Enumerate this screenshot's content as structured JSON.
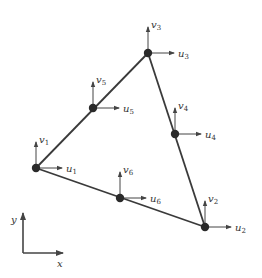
{
  "diagram": {
    "type": "six-node triangular finite element with nodal displacement DOFs",
    "colors": {
      "edge": "#3a3a3a",
      "node": "#2a2a2a",
      "arrow": "#444444",
      "text": "#333333"
    },
    "nodes": [
      {
        "id": 1,
        "x": 36,
        "y": 168,
        "u_label": "u",
        "u_sub": "1",
        "v_label": "v",
        "v_sub": "1"
      },
      {
        "id": 2,
        "x": 205,
        "y": 227,
        "u_label": "u",
        "u_sub": "2",
        "v_label": "v",
        "v_sub": "2"
      },
      {
        "id": 3,
        "x": 148,
        "y": 53,
        "u_label": "u",
        "u_sub": "3",
        "v_label": "v",
        "v_sub": "3"
      },
      {
        "id": 4,
        "x": 175,
        "y": 134,
        "u_label": "u",
        "u_sub": "4",
        "v_label": "v",
        "v_sub": "4"
      },
      {
        "id": 5,
        "x": 93,
        "y": 108,
        "u_label": "u",
        "u_sub": "5",
        "v_label": "v",
        "v_sub": "5"
      },
      {
        "id": 6,
        "x": 120,
        "y": 198,
        "u_label": "u",
        "u_sub": "6",
        "v_label": "v",
        "v_sub": "6"
      }
    ],
    "edges": [
      [
        1,
        3
      ],
      [
        3,
        2
      ],
      [
        2,
        1
      ]
    ],
    "axes": {
      "origin_x": 23,
      "origin_y": 253,
      "x_label": "x",
      "y_label": "y"
    }
  }
}
